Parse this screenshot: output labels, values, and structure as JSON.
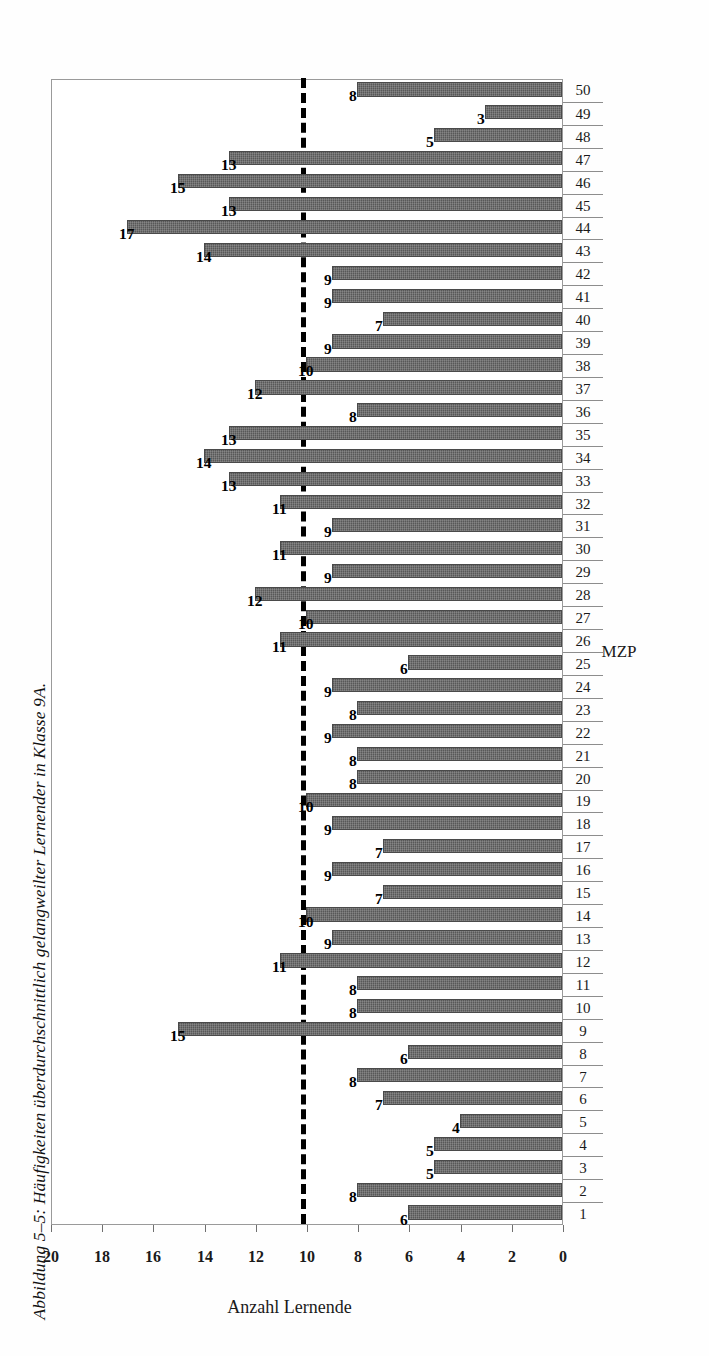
{
  "caption": "Abbildung 5–5: Häufigkeiten überdurchschnittlich gelangweilter Lernender in Klasse 9A.",
  "colors": {
    "bar_fill": "#585858",
    "bar_edge": "#4a4a4a",
    "reference_line": "#000000",
    "axis": "#8d8d8d",
    "text": "#1a1a1a"
  },
  "chart_data": {
    "type": "bar",
    "orientation": "vertical",
    "title": "",
    "xlabel": "MZP",
    "ylabel": "Anzahl Lernende",
    "ylim": [
      0,
      20
    ],
    "ytick_values": [
      0,
      2,
      4,
      6,
      8,
      10,
      12,
      14,
      16,
      18,
      20
    ],
    "ytick_labels": [
      "0",
      "2",
      "4",
      "6",
      "8",
      "10",
      "12",
      "14",
      "16",
      "18",
      "20"
    ],
    "grid": false,
    "legend": false,
    "data_labels": true,
    "reference_line": {
      "value": 10,
      "style": "dashed",
      "label": ""
    },
    "categories": [
      "1",
      "2",
      "3",
      "4",
      "5",
      "6",
      "7",
      "8",
      "9",
      "10",
      "11",
      "12",
      "13",
      "14",
      "15",
      "16",
      "17",
      "18",
      "19",
      "20",
      "21",
      "22",
      "23",
      "24",
      "25",
      "26",
      "27",
      "28",
      "29",
      "30",
      "31",
      "32",
      "33",
      "34",
      "35",
      "36",
      "37",
      "38",
      "39",
      "40",
      "41",
      "42",
      "43",
      "44",
      "45",
      "46",
      "47",
      "48",
      "49",
      "50"
    ],
    "values": [
      6,
      8,
      5,
      5,
      4,
      7,
      8,
      6,
      15,
      8,
      8,
      11,
      9,
      10,
      7,
      9,
      7,
      9,
      10,
      8,
      8,
      9,
      8,
      9,
      6,
      11,
      10,
      12,
      9,
      11,
      9,
      11,
      13,
      14,
      13,
      8,
      12,
      10,
      9,
      7,
      9,
      9,
      14,
      17,
      13,
      15,
      13,
      5,
      3,
      8
    ]
  }
}
